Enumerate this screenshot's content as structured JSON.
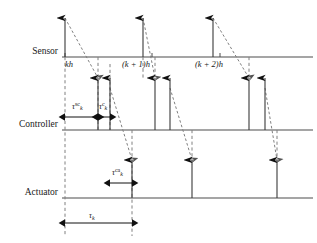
{
  "figure": {
    "kind": "networked-control-system-timing-diagram",
    "background": "#ffffff",
    "line_color": "#4d4d4d",
    "dash_color": "#808080",
    "text_color": "#1a1a1a",
    "width": 317,
    "height": 243
  },
  "axes": [
    {
      "id": "sensor",
      "label": "Sensor",
      "baseline_y": 57,
      "x_start": 62,
      "x_end": 313
    },
    {
      "id": "controller",
      "label": "Controller",
      "baseline_y": 130,
      "x_start": 62,
      "x_end": 313
    },
    {
      "id": "actuator",
      "label": "Actuator",
      "baseline_y": 198,
      "x_start": 62,
      "x_end": 313
    }
  ],
  "time_ticks": [
    {
      "label": "kh",
      "x": 65,
      "text_x": 65,
      "text_y": 59
    },
    {
      "label": "(k + 1)h",
      "x": 152,
      "text_x": 122,
      "text_y": 59
    },
    {
      "label": "(k + 2)h",
      "x": 220,
      "text_x": 195,
      "text_y": 59
    }
  ],
  "sensor_events": [
    {
      "x": 65,
      "desc": "sampling-instant-k"
    },
    {
      "x": 143,
      "desc": "sampling-instant-k-plus-1"
    },
    {
      "x": 213,
      "desc": "sampling-instant-k-plus-2"
    }
  ],
  "controller_events": [
    {
      "x": 98,
      "desc": "message-arrival-k"
    },
    {
      "x": 110,
      "desc": "control-computed-k"
    },
    {
      "x": 155,
      "desc": "message-arrival-k-plus-1"
    },
    {
      "x": 170,
      "desc": "control-computed-k-plus-1"
    },
    {
      "x": 249,
      "desc": "message-arrival-k-plus-2"
    },
    {
      "x": 265,
      "desc": "control-computed-k-plus-2"
    }
  ],
  "actuator_events": [
    {
      "x": 132,
      "desc": "actuation-k"
    },
    {
      "x": 192,
      "desc": "actuation-k-plus-1"
    },
    {
      "x": 277,
      "desc": "actuation-k-plus-2"
    }
  ],
  "network_transmissions": [
    {
      "from_x": 65,
      "from_y": 18,
      "to_x": 98,
      "to_y": 78,
      "desc": "sensor-to-controller-k"
    },
    {
      "from_x": 143,
      "from_y": 18,
      "to_x": 155,
      "to_y": 78,
      "desc": "sensor-to-controller-k-plus-1"
    },
    {
      "from_x": 213,
      "from_y": 18,
      "to_x": 249,
      "to_y": 78,
      "desc": "sensor-to-controller-k-plus-2"
    },
    {
      "from_x": 110,
      "from_y": 88,
      "to_x": 132,
      "to_y": 160,
      "desc": "controller-to-actuator-k"
    },
    {
      "from_x": 170,
      "from_y": 88,
      "to_x": 192,
      "to_y": 160,
      "desc": "controller-to-actuator-k-plus-1"
    },
    {
      "from_x": 265,
      "from_y": 88,
      "to_x": 277,
      "to_y": 160,
      "desc": "controller-to-actuator-k-plus-2"
    }
  ],
  "dashed_guides": [
    {
      "x": 65,
      "y1": 57,
      "y2": 236,
      "desc": "guide-kh"
    },
    {
      "x": 98,
      "y1": 57,
      "y2": 130,
      "desc": "guide-controller-arrival"
    },
    {
      "x": 110,
      "y1": 64,
      "y2": 130,
      "desc": "guide-controller-compute"
    },
    {
      "x": 132,
      "y1": 130,
      "y2": 236,
      "desc": "guide-actuation"
    },
    {
      "x": 143,
      "y1": 57,
      "y2": 80,
      "desc": "guide-k-plus-1-h"
    },
    {
      "x": 155,
      "y1": 57,
      "y2": 80,
      "desc": "guide-controller-arrival-2"
    },
    {
      "x": 192,
      "y1": 130,
      "y2": 165,
      "desc": "guide-actuation-2"
    },
    {
      "x": 249,
      "y1": 57,
      "y2": 80,
      "desc": "guide-controller-arrival-3"
    },
    {
      "x": 277,
      "y1": 130,
      "y2": 165,
      "desc": "guide-actuation-3"
    }
  ],
  "interval_markers": [
    {
      "id": "tau-sc",
      "x1": 65,
      "x2": 98,
      "y": 117,
      "label_prefix": "τ",
      "label_sub": "k",
      "label_sup": "sc",
      "label_x": 72,
      "label_y": 101,
      "desc": "sensor-to-controller-delay"
    },
    {
      "id": "tau-c",
      "x1": 98,
      "x2": 110,
      "y": 117,
      "label_prefix": "τ",
      "label_sub": "k",
      "label_sup": "c",
      "label_x": 99,
      "label_y": 101,
      "desc": "controller-computation-delay"
    },
    {
      "id": "tau-ca",
      "x1": 110,
      "x2": 132,
      "y": 183,
      "label_prefix": "τ",
      "label_sub": "k",
      "label_sup": "ca",
      "label_x": 112,
      "label_y": 167,
      "desc": "controller-to-actuator-delay"
    },
    {
      "id": "tau-k",
      "x1": 65,
      "x2": 132,
      "y": 223,
      "label_prefix": "τ",
      "label_sub": "k",
      "label_sup": "",
      "label_x": 89,
      "label_y": 211,
      "desc": "total-round-trip-delay"
    }
  ]
}
